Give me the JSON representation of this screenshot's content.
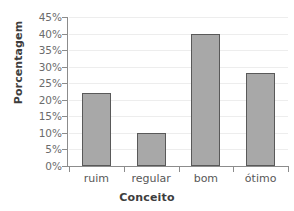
{
  "chart_data": {
    "type": "bar",
    "title": "",
    "xlabel": "Conceito",
    "ylabel": "Porcentagem",
    "categories": [
      "ruim",
      "regular",
      "bom",
      "ótimo"
    ],
    "values": [
      22,
      10,
      40,
      28
    ],
    "value_labels": [
      "22%",
      "10%",
      "40%",
      "28%"
    ],
    "ylim": [
      0,
      45
    ],
    "ytick_values": [
      0,
      5,
      10,
      15,
      20,
      25,
      30,
      35,
      40,
      45
    ],
    "ytick_labels": [
      "0%",
      "5%",
      "10%",
      "15%",
      "20%",
      "25%",
      "30%",
      "35%",
      "40%",
      "45%"
    ],
    "grid": true,
    "grid_axis": "y",
    "legend": false,
    "legend_position": "none",
    "series": [
      {
        "name": "Porcentagem",
        "values": [
          22,
          10,
          40,
          28
        ]
      }
    ],
    "colors": {
      "bar_fill": "#a8a8a8",
      "bar_border": "#595959",
      "gridline": "#ededed",
      "axis": "#8c8c8c",
      "tick_label": "#6b6b6b",
      "axis_title": "#3d3d3d",
      "background": "#ffffff"
    }
  }
}
